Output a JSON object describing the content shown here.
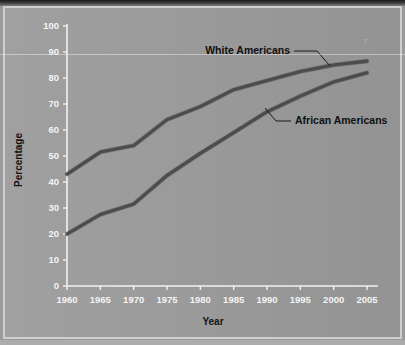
{
  "figure": {
    "background_color": "#9b9b9b",
    "frame_color": "#cfcfcf",
    "line_color": "#4c4c4c",
    "tick_label_color": "#f4f4f4",
    "axis_title_color": "#141414"
  },
  "chart_data": {
    "type": "line",
    "title": "",
    "subtitle": "",
    "xlabel": "Year",
    "ylabel": "Percentage",
    "x": [
      1960,
      1965,
      1970,
      1975,
      1980,
      1985,
      1990,
      1995,
      2000,
      2005
    ],
    "xlim": [
      1960,
      2005
    ],
    "ylim": [
      0,
      100
    ],
    "xticks": [
      "1960",
      "1965",
      "1970",
      "1975",
      "1980",
      "1985",
      "1990",
      "1995",
      "2000",
      "2005"
    ],
    "yticks": [
      "0",
      "10",
      "20",
      "30",
      "40",
      "50",
      "60",
      "70",
      "80",
      "90",
      "100"
    ],
    "grid": false,
    "legend_position": "inline-annotation",
    "series": [
      {
        "name": "White Americans",
        "values": [
          43,
          51.5,
          54,
          64,
          69,
          75.5,
          79,
          82.5,
          85,
          86.5
        ],
        "color": "#4c4c4c"
      },
      {
        "name": "African Americans",
        "values": [
          20,
          27.5,
          31.5,
          42.5,
          51,
          59,
          67,
          73,
          78.5,
          82
        ],
        "color": "#4c4c4c"
      }
    ],
    "annotations": [
      {
        "text": "White Americans",
        "target_x": 1990,
        "target_y": 79
      },
      {
        "text": "African Americans",
        "target_x": 1990,
        "target_y": 67
      }
    ]
  },
  "corner_mark": "7"
}
